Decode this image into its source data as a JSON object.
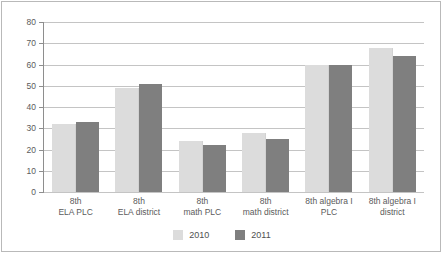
{
  "chart_data": {
    "type": "bar",
    "title": "",
    "subtitle": "",
    "xlabel": "",
    "ylabel": "",
    "ylim": [
      0,
      80
    ],
    "ytick_step": 10,
    "yticks": [
      "80",
      "70",
      "60",
      "50",
      "40",
      "30",
      "20",
      "10",
      "0"
    ],
    "grid": true,
    "legend_position": "bottom-center",
    "categories": [
      "8th\nELA PLC",
      "8th\nELA district",
      "8th\nmath PLC",
      "8th\nmath district",
      "8th algebra I\nPLC",
      "8th algebra I\ndistrict"
    ],
    "category_lines": [
      [
        "8th",
        "ELA PLC"
      ],
      [
        "8th",
        "ELA district"
      ],
      [
        "8th",
        "math PLC"
      ],
      [
        "8th",
        "math district"
      ],
      [
        "8th algebra I",
        "PLC"
      ],
      [
        "8th algebra I",
        "district"
      ]
    ],
    "series": [
      {
        "name": "2010",
        "color": "#DCDCDC",
        "values": [
          32,
          49,
          24,
          28,
          60,
          68
        ]
      },
      {
        "name": "2011",
        "color": "#7F7F7F",
        "values": [
          33,
          51,
          22,
          25,
          60,
          64
        ]
      }
    ]
  },
  "legend": {
    "items": [
      {
        "label": "2010",
        "color": "#DCDCDC"
      },
      {
        "label": "2011",
        "color": "#7F7F7F"
      }
    ]
  },
  "colors": {
    "series_2010": "#DCDCDC",
    "series_2011": "#7F7F7F",
    "gridline": "#C4C4C4",
    "axis": "#8E8E8E",
    "frame_border": "#B9B9B9",
    "tick_text": "#5B5B5B",
    "background": "#FFFFFF"
  }
}
